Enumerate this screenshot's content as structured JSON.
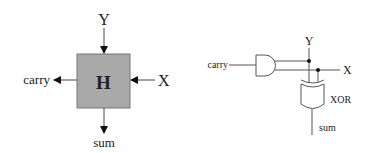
{
  "block_diagram": {
    "box_label": "H",
    "box_fill": "#a9a9a9",
    "inputs": {
      "top": "Y",
      "right": "X"
    },
    "outputs": {
      "left": "carry",
      "bottom": "sum"
    }
  },
  "gate_diagram": {
    "inputs": {
      "y": "Y",
      "x": "X"
    },
    "and_output_label": "carry",
    "xor_label": "XOR",
    "xor_output_label": "sum"
  }
}
